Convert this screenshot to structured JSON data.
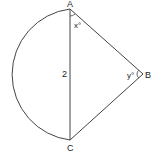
{
  "diagram": {
    "points": {
      "A": "A",
      "B": "B",
      "C": "C"
    },
    "side_label_AC": "2",
    "angle_A": "x°",
    "angle_B": "y°",
    "colors": {
      "stroke": "#333333",
      "background": "#ffffff"
    }
  }
}
